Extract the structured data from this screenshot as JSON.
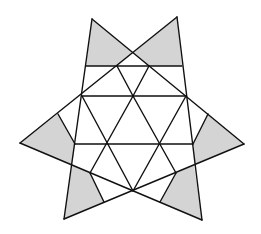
{
  "diagram": {
    "type": "six-pointed star dissection into triangles",
    "colors": {
      "line": "#111111",
      "shade": "#d4d4d4",
      "background": "#ffffff"
    },
    "shaded_regions": 6,
    "points": {
      "tip_top_left": [
        92,
        19
      ],
      "tip_top_right": [
        177,
        17
      ],
      "tip_left": [
        20,
        143
      ],
      "tip_right": [
        244,
        144
      ],
      "tip_bottom_left": [
        64,
        219
      ],
      "tip_bottom_right": [
        202,
        220
      ],
      "cross_top": [
        133,
        53
      ],
      "bottom_center": [
        133,
        191
      ]
    }
  }
}
